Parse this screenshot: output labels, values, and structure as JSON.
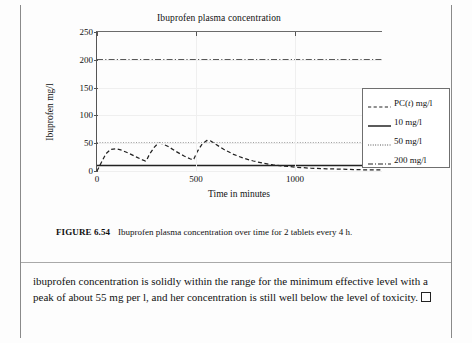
{
  "figure": {
    "caption_label": "FIGURE 6.54",
    "caption_text": "Ibuprofen plasma concentration over time for 2 tablets every 4 h."
  },
  "body": {
    "paragraph": "ibuprofen concentration is solidly within the range for the minimum effective level with a peak of about 55 mg per l, and her concentration is still well below the level of toxicity.",
    "qed_symbol": "□"
  },
  "legend": {
    "items": [
      {
        "label": "PC(t) mg/l",
        "label_prefix": "PC(",
        "label_italic": "t",
        "label_suffix": ") mg/l",
        "style": "dashed",
        "color": "#222222"
      },
      {
        "label": "10 mg/l",
        "style": "solid",
        "color": "#333333"
      },
      {
        "label": "50 mg/l",
        "style": "dotted",
        "color": "#444444"
      },
      {
        "label": "200 mg/l",
        "style": "dashdot",
        "color": "#222222"
      }
    ]
  },
  "chart_data": {
    "type": "line",
    "title": "Ibuprofen plasma concentration",
    "xlabel": "Time in minutes",
    "ylabel": "Ibuprofen mg/l",
    "xlim": [
      0,
      1440
    ],
    "ylim": [
      0,
      250
    ],
    "xticks": [
      0,
      500,
      1000
    ],
    "yticks": [
      0,
      50,
      100,
      150,
      200,
      250
    ],
    "xticklabels": [
      "0",
      "500",
      "1000"
    ],
    "yticklabels": [
      "0",
      "50",
      "100",
      "150",
      "200",
      "250"
    ],
    "grid": true,
    "legend_position": "right-outside",
    "series": [
      {
        "name": "PC(t) mg/l",
        "style": "dashed",
        "x": [
          0,
          20,
          45,
          70,
          95,
          120,
          160,
          200,
          230,
          245,
          250,
          265,
          290,
          310,
          330,
          360,
          400,
          440,
          470,
          485,
          490,
          505,
          530,
          555,
          575,
          600,
          640,
          690,
          740,
          790,
          840,
          890,
          940,
          1000,
          1080,
          1160,
          1260,
          1360,
          1440
        ],
        "y": [
          0,
          14,
          31,
          39,
          40,
          38,
          32,
          25,
          20,
          18,
          19,
          30,
          43,
          50,
          49,
          44,
          35,
          27,
          22,
          20,
          22,
          34,
          48,
          55,
          54,
          48,
          39,
          30,
          23,
          18,
          14,
          11,
          9,
          7,
          5,
          4,
          3,
          2,
          2
        ]
      },
      {
        "name": "10 mg/l",
        "style": "solid",
        "constant": 10
      },
      {
        "name": "50 mg/l",
        "style": "dotted",
        "constant": 50
      },
      {
        "name": "200 mg/l",
        "style": "dashdot",
        "constant": 200
      }
    ],
    "annotations": [
      "peak of about 55 mg per l"
    ]
  }
}
